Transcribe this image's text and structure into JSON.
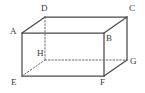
{
  "figure": {
    "name": "cuboid-abcdefgh",
    "kind": "3d-geometry-diagram",
    "background_color": "#ffffff",
    "solid_edge_color": "#4a4a4a",
    "hidden_edge_color": "#6b6b6b",
    "label_color": "#3a3a3a",
    "canvas": {
      "width": 145,
      "height": 93
    }
  },
  "vertices": {
    "A": {
      "label": "A",
      "x": 22,
      "y": 33,
      "label_x": 10,
      "label_y": 27,
      "hidden": false
    },
    "B": {
      "label": "B",
      "x": 104,
      "y": 33,
      "label_x": 106,
      "label_y": 34,
      "hidden": false
    },
    "C": {
      "label": "C",
      "x": 127,
      "y": 17,
      "label_x": 129,
      "label_y": 4,
      "hidden": false
    },
    "D": {
      "label": "D",
      "x": 45,
      "y": 17,
      "label_x": 41,
      "label_y": 4,
      "hidden": false
    },
    "E": {
      "label": "E",
      "x": 22,
      "y": 76,
      "label_x": 11,
      "label_y": 78,
      "hidden": false
    },
    "F": {
      "label": "F",
      "x": 104,
      "y": 76,
      "label_x": 100,
      "label_y": 78,
      "hidden": false
    },
    "G": {
      "label": "G",
      "x": 127,
      "y": 60,
      "label_x": 130,
      "label_y": 57,
      "hidden": false
    },
    "H": {
      "label": "H",
      "x": 45,
      "y": 60,
      "label_x": 37,
      "label_y": 49,
      "hidden": true
    }
  },
  "edges": [
    {
      "name": "edge-A-D",
      "from": "A",
      "to": "D",
      "style": "solid"
    },
    {
      "name": "edge-D-C",
      "from": "D",
      "to": "C",
      "style": "solid"
    },
    {
      "name": "edge-A-B",
      "from": "A",
      "to": "B",
      "style": "solid"
    },
    {
      "name": "edge-B-C",
      "from": "B",
      "to": "C",
      "style": "solid"
    },
    {
      "name": "edge-A-E",
      "from": "A",
      "to": "E",
      "style": "solid"
    },
    {
      "name": "edge-B-F",
      "from": "B",
      "to": "F",
      "style": "solid"
    },
    {
      "name": "edge-C-G",
      "from": "C",
      "to": "G",
      "style": "solid"
    },
    {
      "name": "edge-E-F",
      "from": "E",
      "to": "F",
      "style": "solid"
    },
    {
      "name": "edge-F-G",
      "from": "F",
      "to": "G",
      "style": "solid"
    },
    {
      "name": "edge-D-H",
      "from": "D",
      "to": "H",
      "style": "dashed"
    },
    {
      "name": "edge-E-H",
      "from": "E",
      "to": "H",
      "style": "dashed"
    },
    {
      "name": "edge-H-G",
      "from": "H",
      "to": "G",
      "style": "dashed"
    }
  ]
}
